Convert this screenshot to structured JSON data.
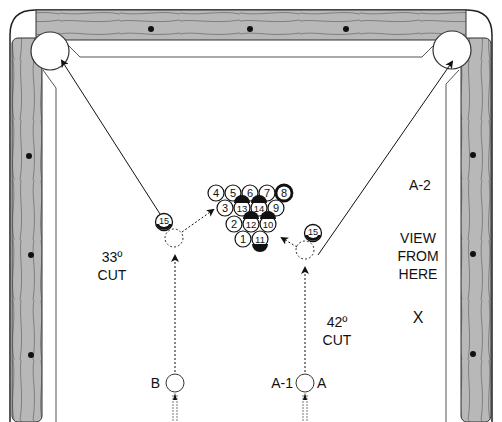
{
  "diagram": {
    "type": "pool-table-shot-diagram",
    "colors": {
      "rail_wood": "#b4b4b4",
      "rail_edge": "#333333",
      "cloth": "#ffffff",
      "line": "#222222"
    },
    "labels": {
      "left_cut_angle": "33º",
      "left_cut_word": "CUT",
      "right_cut_angle": "42º",
      "right_cut_word": "CUT",
      "position_a2": "A-2",
      "view_line1": "VIEW",
      "view_line2": "FROM",
      "view_line3": "HERE",
      "view_marker": "X",
      "cue_ball_b": "B",
      "cue_ball_a1": "A-1",
      "cue_ball_a": "A"
    },
    "object_ball_left": "15",
    "object_ball_right": "15",
    "rack": {
      "row1": [
        "4",
        "5",
        "6",
        "7",
        "8"
      ],
      "row2": [
        "3",
        "13",
        "14",
        "9"
      ],
      "row3": [
        "2",
        "12",
        "10"
      ],
      "row4": [
        "1",
        "11"
      ]
    },
    "pockets": [
      "top-left-corner-pocket",
      "top-right-corner-pocket"
    ],
    "diamonds": {
      "top_rail": 4,
      "left_rail": 3,
      "right_rail": 3
    }
  }
}
